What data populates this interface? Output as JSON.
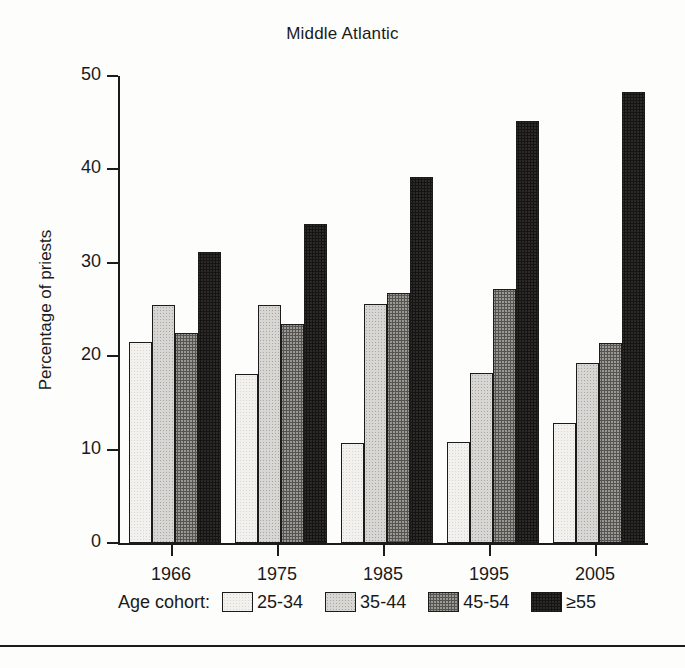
{
  "chart_data": {
    "type": "bar",
    "title": "Middle Atlantic",
    "xlabel": "",
    "ylabel": "Percentage of priests",
    "categories": [
      "1966",
      "1975",
      "1985",
      "1995",
      "2005"
    ],
    "ylim": [
      0,
      50
    ],
    "yticks": [
      0,
      10,
      20,
      30,
      40,
      50
    ],
    "ytick_labels": [
      "0",
      "10",
      "20",
      "30",
      "40",
      "50"
    ],
    "grid": false,
    "legend_position": "below-axis",
    "legend_title": "Age cohort:",
    "series": [
      {
        "name": "25-34",
        "color": "#f2f1ee",
        "values": [
          21.5,
          18.1,
          10.7,
          10.8,
          12.8
        ]
      },
      {
        "name": "35-44",
        "color": "#d7d6d2",
        "values": [
          25.5,
          25.5,
          25.6,
          18.2,
          19.3
        ]
      },
      {
        "name": "45-54",
        "color": "#9a9893",
        "values": [
          22.5,
          23.5,
          26.8,
          27.2,
          21.4
        ]
      },
      {
        "name": "≥55",
        "color": "#2d2b29",
        "values": [
          31.2,
          34.2,
          39.2,
          45.2,
          48.3
        ]
      }
    ]
  },
  "axis": {
    "tick_color": "#1b1b1b",
    "line_color": "#1b1b1b"
  }
}
